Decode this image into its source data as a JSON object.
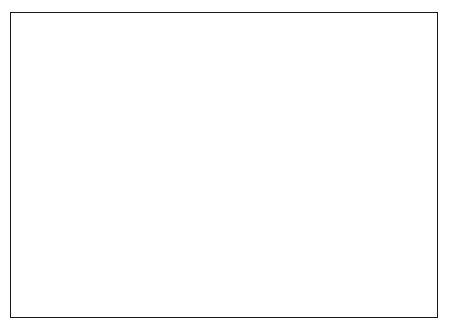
{
  "chart_data": {
    "type": "area",
    "stacked": true,
    "title": "",
    "xlabel": "% Stock / % Bonds",
    "ylabel": "Probability",
    "ylim": [
      0,
      0.875
    ],
    "xlim": [
      0,
      100
    ],
    "grid": false,
    "legend_position": "right",
    "x": [
      0,
      10,
      20,
      30,
      40,
      50,
      60,
      70,
      80,
      90,
      100
    ],
    "x_tick_labels_stock": [
      "0",
      "10",
      "20",
      "30",
      "40",
      "50",
      "60",
      "70",
      "80",
      "90",
      "100"
    ],
    "x_tick_labels_bonds": [
      "100",
      "90",
      "80",
      "70",
      "60",
      "50",
      "40",
      "30",
      "20",
      "10",
      "0"
    ],
    "x_axis_caption_top": "% Stock",
    "x_axis_caption_bottom": "% Bonds",
    "x_axis_separator": "/",
    "y_tick_labels": [
      ".75",
      ".50",
      ".25"
    ],
    "y_tick_values": [
      0.75,
      0.5,
      0.25
    ],
    "cumulative_series": [
      {
        "name": "10% Below Actuarial Assumption",
        "color": "#c9c9c9",
        "label_line1": "10% Below Actuarial",
        "label_line2": "Assumption",
        "values": [
          0.695,
          0.7,
          0.655,
          0.525,
          0.345,
          0.235,
          0.225,
          0.225,
          0.215,
          0.215,
          0.225
        ]
      },
      {
        "name": "20% Below Actuarial Assumption",
        "color": "#6e6e6e",
        "label_line1": "20% Below Actuarial",
        "label_line2": "Assumption",
        "values": [
          0.44,
          0.375,
          0.285,
          0.205,
          0.145,
          0.12,
          0.12,
          0.125,
          0.135,
          0.14,
          0.155
        ]
      },
      {
        "name": "30% Below Actuarial Assumption",
        "color": "#090909",
        "label_line1": "30% Below Actuarial",
        "label_line2": "Assumption",
        "values": [
          0.255,
          0.175,
          0.105,
          0.06,
          0.035,
          0.03,
          0.035,
          0.04,
          0.06,
          0.085,
          0.105
        ]
      }
    ]
  }
}
